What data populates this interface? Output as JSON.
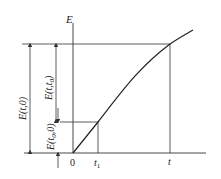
{
  "diagram": {
    "axis_y_label": "E",
    "origin_label": "0",
    "tick_t1": "t",
    "tick_t1_sub": "1",
    "tick_t": "t",
    "dim_left_label": "E(t,0)",
    "dim_mid_label": "E(t,t",
    "dim_mid_sub": "0",
    "dim_mid_close": ")",
    "dim_low_label": "E(t",
    "dim_low_sub": "0",
    "dim_low_close": ",0)",
    "colors": {
      "line": "#333333",
      "background": "#ffffff"
    }
  }
}
